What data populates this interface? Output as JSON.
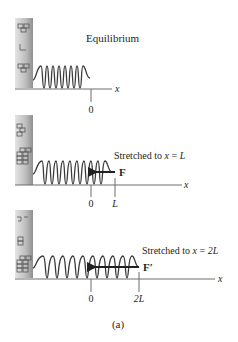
{
  "figure": {
    "caption": "(a)",
    "colors": {
      "ink": "#231f20",
      "wall_light": "#d9d9d9",
      "wall_dark": "#9a9a9a",
      "spring": "#3a3a3a",
      "axis": "#6d6d6d"
    }
  },
  "panels": [
    {
      "title": "Equilibrium",
      "axis_label": "x",
      "ticks": [
        {
          "label": "0"
        }
      ],
      "force": null
    },
    {
      "title_prefix": "Stretched to ",
      "title_var": "x",
      "title_eq": " = ",
      "title_val": "L",
      "axis_label": "x",
      "ticks": [
        {
          "label": "0"
        },
        {
          "label": "L"
        }
      ],
      "force": {
        "label": "F",
        "direction": "left"
      }
    },
    {
      "title_prefix": "Stretched to ",
      "title_var": "x",
      "title_eq": " = ",
      "title_val": "2L",
      "axis_label": "x",
      "ticks": [
        {
          "label": "0"
        },
        {
          "label": "2L"
        }
      ],
      "force": {
        "label": "F′",
        "direction": "left"
      }
    }
  ]
}
